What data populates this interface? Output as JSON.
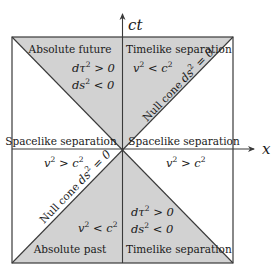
{
  "axes": {
    "vertical_label": "ct",
    "horizontal_label": "x"
  },
  "colors": {
    "cone_fill": "#d2d2d2",
    "line": "#3a3a3a",
    "background": "#ffffff"
  },
  "regions": {
    "top_left": {
      "title": "Absolute future",
      "line1": {
        "base": "dτ",
        "exp": "2",
        "rest": " > 0"
      },
      "line2": {
        "base": "ds",
        "exp": "2",
        "rest": " < 0"
      }
    },
    "top_right": {
      "title": "Timelike separation",
      "line1": {
        "base": "v",
        "exp": "2",
        "rest": " < c",
        "exp2": "2"
      }
    },
    "left": {
      "title": "Spacelike separation",
      "line1": {
        "base": "v",
        "exp": "2",
        "rest": " > c",
        "exp2": "2"
      }
    },
    "right": {
      "title": "Spacelike separation",
      "line1": {
        "base": "v",
        "exp": "2",
        "rest": " > c",
        "exp2": "2"
      }
    },
    "bottom_left": {
      "title": "Absolute past",
      "line1": {
        "base": "v",
        "exp": "2",
        "rest": " < c",
        "exp2": "2"
      }
    },
    "bottom_right": {
      "title": "Timelike separation",
      "line1": {
        "base": "dτ",
        "exp": "2",
        "rest": " > 0"
      },
      "line2": {
        "base": "ds",
        "exp": "2",
        "rest": " < 0"
      }
    }
  },
  "null_cone": {
    "upper": {
      "word": "Null cone ",
      "base": "ds",
      "exp": "2",
      "rest": " = 0"
    },
    "lower": {
      "word": "Null cone ",
      "base": "ds",
      "exp": "2",
      "rest": " = 0"
    }
  }
}
